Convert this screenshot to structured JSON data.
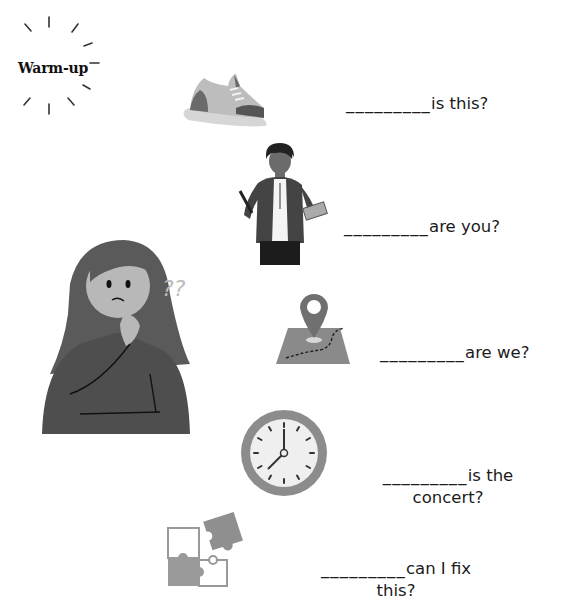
{
  "title": "Warm-up",
  "questions": [
    {
      "blank": "_________",
      "line1": "is this?",
      "line2": "",
      "image": "shoe-icon"
    },
    {
      "blank": "_________",
      "line1": "are you?",
      "line2": "",
      "image": "teacher-figure"
    },
    {
      "blank": "_________",
      "line1": "are we?",
      "line2": "",
      "image": "map-pin-icon"
    },
    {
      "blank": "_________",
      "line1": "is the",
      "line2": "concert?",
      "image": "clock-icon"
    },
    {
      "blank": "_________",
      "line1": "can I fix",
      "line2": "this?",
      "image": "puzzle-icon"
    }
  ],
  "decoration": {
    "thinking_girl": "confused-girl-illustration",
    "question_marks": "??"
  },
  "colors": {
    "ink": "#1b1b1b",
    "gray_dark": "#5c5c5c",
    "gray_mid": "#8a8a8a",
    "gray_light": "#c8c8c8"
  }
}
